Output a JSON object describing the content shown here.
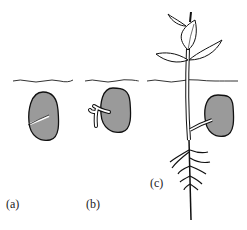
{
  "figure": {
    "panels": [
      {
        "label": "(a)",
        "description": "seed with emerging radicle"
      },
      {
        "label": "(b)",
        "description": "seed with branched young root"
      },
      {
        "label": "(c)",
        "description": "seedling with shoot, leaves above soil and branched root system"
      }
    ],
    "colors": {
      "seed_fill": "#9a9a9a",
      "line": "#1a1a1a",
      "background": "#ffffff"
    }
  }
}
